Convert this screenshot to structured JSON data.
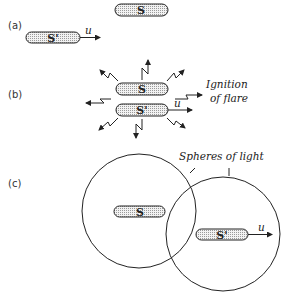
{
  "panels": {
    "a": {
      "label": "(a)",
      "source_top": "S",
      "source_moving": "S'",
      "velocity": "u"
    },
    "b": {
      "label": "(b)",
      "source_top": "S",
      "source_moving": "S'",
      "velocity": "u",
      "annotation_line1": "Ignition",
      "annotation_line2": "of flare"
    },
    "c": {
      "label": "(c)",
      "source_left": "S",
      "source_moving": "S'",
      "velocity": "u",
      "annotation": "Spheres of light"
    }
  },
  "colors": {
    "stroke": "#222222",
    "fill": "#d8d8d8"
  }
}
